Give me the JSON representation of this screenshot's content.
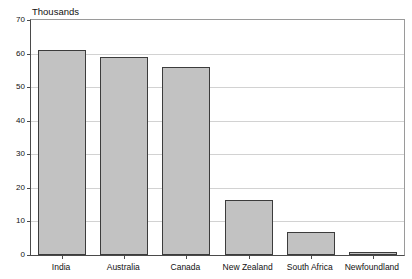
{
  "chart_data": {
    "type": "bar",
    "title": "",
    "subtitle": "",
    "unit_label": "Thousands",
    "xlabel": "",
    "ylabel": "",
    "categories": [
      "India",
      "Australia",
      "Canada",
      "New Zealand",
      "South Africa",
      "Newfoundland"
    ],
    "values": [
      61,
      59,
      56,
      16.5,
      7,
      1
    ],
    "ylim": [
      0,
      70
    ],
    "ytick_labels": [
      "0",
      "10",
      "20",
      "30",
      "40",
      "50",
      "60",
      "70"
    ],
    "ytick_values": [
      0,
      10,
      20,
      30,
      40,
      50,
      60,
      70
    ],
    "grid": true,
    "legend": false,
    "legend_position": "none",
    "colors": {
      "bar_fill": "#c2c2c2",
      "bar_border": "#3c3c3c",
      "gridline": "#d2d2d2",
      "axis": "#4a4a4a",
      "frame": "#9a9a9a",
      "text": "#111111",
      "background": "#ffffff"
    }
  }
}
